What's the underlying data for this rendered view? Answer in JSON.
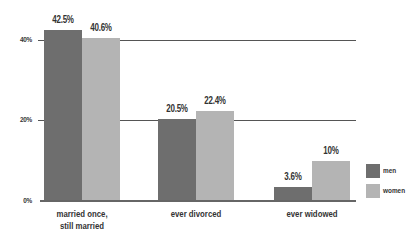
{
  "chart_data": {
    "type": "bar",
    "title": "",
    "xlabel": "",
    "ylabel": "",
    "ylim": [
      0,
      45
    ],
    "yticks": [
      "0%",
      "20%",
      "40%"
    ],
    "grid": true,
    "legend_position": "right",
    "categories": [
      "married once, still married",
      "ever divorced",
      "ever widowed"
    ],
    "category_lines": [
      [
        "married once,",
        "still married"
      ],
      [
        "ever divorced"
      ],
      [
        "ever widowed"
      ]
    ],
    "series": [
      {
        "name": "men",
        "color": "#6e6e6e",
        "values": [
          42.5,
          20.5,
          3.6
        ],
        "labels": [
          "42.5%",
          "20.5%",
          "3.6%"
        ]
      },
      {
        "name": "women",
        "color": "#b4b4b4",
        "values": [
          40.6,
          22.4,
          10
        ],
        "labels": [
          "40.6%",
          "22.4%",
          "10%"
        ]
      }
    ]
  }
}
